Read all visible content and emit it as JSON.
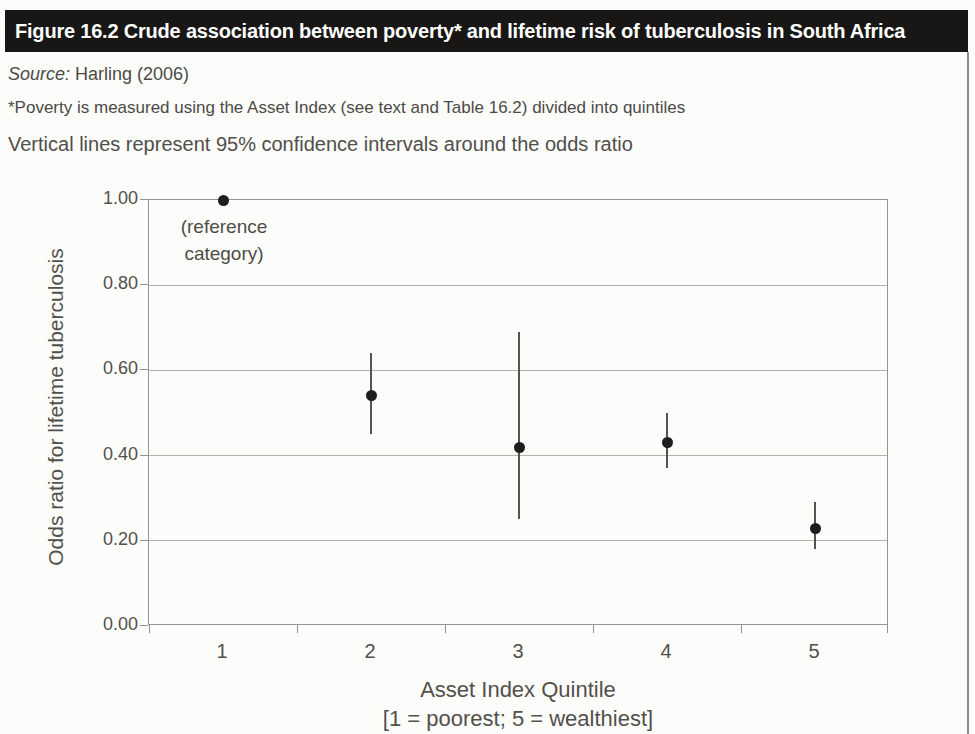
{
  "header": {
    "title": "Figure 16.2 Crude association between poverty* and lifetime risk of tuberculosis in South Africa"
  },
  "notes": {
    "source_label": "Source:",
    "source_text": "Harling (2006)",
    "poverty_note": "*Poverty is measured using the Asset Index (see text and Table 16.2) divided into quintiles",
    "ci_note": "Vertical lines represent 95% confidence intervals around the odds ratio"
  },
  "chart_data": {
    "type": "scatter",
    "categories": [
      "1",
      "2",
      "3",
      "4",
      "5"
    ],
    "series": [
      {
        "name": "Odds ratio",
        "values": [
          1.0,
          0.54,
          0.42,
          0.43,
          0.23
        ],
        "ci_low": [
          null,
          0.45,
          0.25,
          0.37,
          0.18
        ],
        "ci_high": [
          null,
          0.64,
          0.69,
          0.5,
          0.29
        ]
      }
    ],
    "annotation": {
      "lines": [
        "(reference",
        "category)"
      ],
      "target_category": "1"
    },
    "xlabel": "Asset Index Quintile",
    "xlabel2": "[1 = poorest; 5 = wealthiest]",
    "ylabel": "Odds ratio for lifetime tuberculosis",
    "ylim": [
      0.0,
      1.0
    ],
    "ytick_labels": [
      "1.00",
      "0.80",
      "0.60",
      "0.40",
      "0.20",
      "0.00"
    ],
    "ytick_values": [
      1.0,
      0.8,
      0.6,
      0.4,
      0.2,
      0.0
    ],
    "grid": true,
    "legend": "none"
  },
  "colors": {
    "header_bg": "#181715",
    "header_text": "#ffffff",
    "body_text": "#4c4a47",
    "grid": "#b5b2ac",
    "axis": "#97948f",
    "marker": "#1e1d1b",
    "ci_line": "#55534e"
  }
}
